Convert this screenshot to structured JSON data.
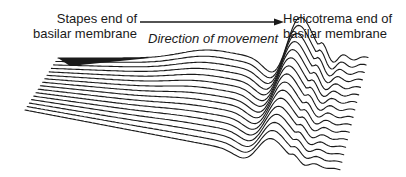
{
  "diagram": {
    "labels": {
      "stapes_end_line1": "Stapes end of",
      "stapes_end_line2": "basilar membrane",
      "helicotrema_end_line1": "Helicotrema end of",
      "helicotrema_end_line2": "basilar membrane",
      "direction": "Direction of movement"
    },
    "arrow": {
      "direction": "left-to-right",
      "from": "stapes-end",
      "to": "helicotrema-end"
    },
    "membrane": {
      "line_count": 16,
      "line_color": "#1a1a1a",
      "background": "#ffffff",
      "features": [
        "shaded far edge near stapes end",
        "gradual rising slope",
        "large traveling-wave crest",
        "diminishing ripples toward helicotrema"
      ]
    }
  }
}
